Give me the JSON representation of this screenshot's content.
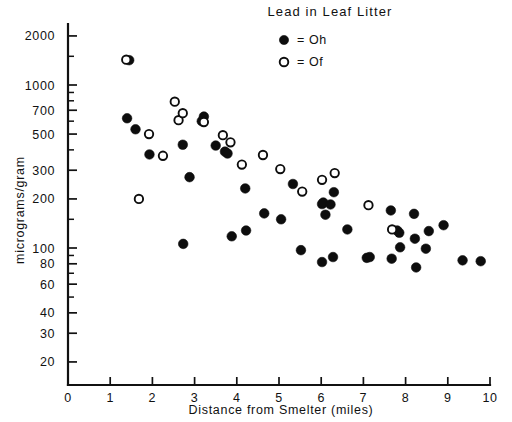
{
  "chart_data": {
    "type": "scatter",
    "title": "Lead in Leaf Litter",
    "xlabel": "Distance from Smelter  (miles)",
    "ylabel": "micrograms/gram",
    "xlim": [
      0,
      10
    ],
    "ylim": [
      15,
      2600
    ],
    "yscale": "log",
    "xscale": "linear",
    "grid": false,
    "legend_position": "top-right inside",
    "xticks": [
      "0",
      "1",
      "2",
      "3",
      "4",
      "5",
      "6",
      "7",
      "8",
      "9",
      "10"
    ],
    "xtick_values": [
      0,
      1,
      2,
      3,
      4,
      5,
      6,
      7,
      8,
      9,
      10
    ],
    "yticks": [
      "2000",
      "1000",
      "700",
      "500",
      "300",
      "200",
      "100",
      "80",
      "60",
      "40",
      "30",
      "20"
    ],
    "ytick_values": [
      2000,
      1000,
      700,
      500,
      300,
      200,
      100,
      80,
      60,
      40,
      30,
      20
    ],
    "ytick_minor_values": [
      1500,
      900,
      800,
      600,
      400,
      150,
      90,
      70,
      50
    ],
    "series": [
      {
        "name": "Oh",
        "legend_label": "= Oh",
        "marker": "filled-circle",
        "color": "#0d0d0d",
        "points": [
          [
            1.45,
            1420
          ],
          [
            1.4,
            625
          ],
          [
            1.6,
            535
          ],
          [
            1.93,
            375
          ],
          [
            2.72,
            430
          ],
          [
            2.88,
            272
          ],
          [
            2.73,
            106
          ],
          [
            3.22,
            640
          ],
          [
            3.17,
            600
          ],
          [
            3.5,
            425
          ],
          [
            3.72,
            390
          ],
          [
            3.78,
            380
          ],
          [
            3.88,
            118
          ],
          [
            4.2,
            232
          ],
          [
            4.22,
            128
          ],
          [
            4.65,
            163
          ],
          [
            5.05,
            150
          ],
          [
            5.33,
            247
          ],
          [
            5.52,
            97
          ],
          [
            6.02,
            186
          ],
          [
            6.05,
            190
          ],
          [
            6.02,
            82
          ],
          [
            6.1,
            160
          ],
          [
            6.22,
            185
          ],
          [
            6.3,
            220
          ],
          [
            6.28,
            88
          ],
          [
            6.62,
            130
          ],
          [
            7.08,
            87
          ],
          [
            7.15,
            88
          ],
          [
            7.65,
            170
          ],
          [
            7.67,
            86
          ],
          [
            7.8,
            128
          ],
          [
            7.85,
            124
          ],
          [
            7.87,
            101
          ],
          [
            8.2,
            162
          ],
          [
            8.22,
            114
          ],
          [
            8.25,
            76
          ],
          [
            8.48,
            99
          ],
          [
            8.55,
            127
          ],
          [
            8.9,
            138
          ],
          [
            9.35,
            84
          ],
          [
            9.78,
            83
          ]
        ]
      },
      {
        "name": "Of",
        "legend_label": "= Of",
        "marker": "open-circle",
        "color": "#0d0d0d",
        "points": [
          [
            1.38,
            1430
          ],
          [
            1.92,
            500
          ],
          [
            1.68,
            200
          ],
          [
            2.25,
            368
          ],
          [
            2.53,
            790
          ],
          [
            2.62,
            608
          ],
          [
            2.72,
            672
          ],
          [
            3.22,
            592
          ],
          [
            3.67,
            492
          ],
          [
            3.85,
            445
          ],
          [
            4.12,
            325
          ],
          [
            4.62,
            372
          ],
          [
            5.03,
            305
          ],
          [
            5.55,
            222
          ],
          [
            6.02,
            262
          ],
          [
            6.32,
            288
          ],
          [
            7.12,
            183
          ],
          [
            7.68,
            130
          ]
        ]
      }
    ]
  }
}
